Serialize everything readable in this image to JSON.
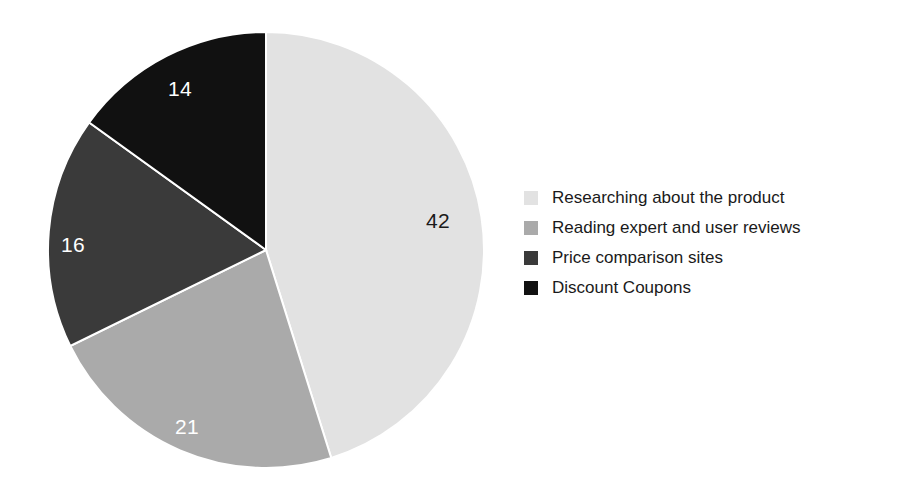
{
  "chart_data": {
    "type": "pie",
    "title": "",
    "subtitle": "",
    "xlabel": "",
    "ylabel": "",
    "grid": false,
    "legend_position": "right",
    "total": 93,
    "start_angle_deg": 0,
    "direction": "clockwise",
    "categories": [
      "Researching about the product",
      "Reading expert and user reviews",
      "Price comparison sites",
      "Discount Coupons"
    ],
    "values": [
      42,
      21,
      16,
      14
    ],
    "value_labels": [
      "42",
      "21",
      "16",
      "14"
    ],
    "colors": [
      "#e2e2e2",
      "#aaaaaa",
      "#3a3a3a",
      "#111111"
    ],
    "label_colors": [
      "#1a1a1a",
      "#ffffff",
      "#ffffff",
      "#ffffff"
    ],
    "slices": [
      {
        "label": "Researching about the product",
        "value": 42,
        "value_text": "42",
        "color": "#e2e2e2",
        "label_color": "#1a1a1a",
        "start_deg": 0,
        "sweep_deg": 162.58,
        "label_x": 438,
        "label_y": 222
      },
      {
        "label": "Reading expert and user reviews",
        "value": 21,
        "value_text": "21",
        "color": "#aaaaaa",
        "label_color": "#ffffff",
        "start_deg": 162.58,
        "sweep_deg": 81.29,
        "label_x": 187,
        "label_y": 428
      },
      {
        "label": "Price comparison sites",
        "value": 16,
        "value_text": "16",
        "color": "#3a3a3a",
        "label_color": "#ffffff",
        "start_deg": 243.87,
        "sweep_deg": 61.94,
        "label_x": 73,
        "label_y": 246
      },
      {
        "label": "Discount Coupons",
        "value": 14,
        "value_text": "14",
        "color": "#111111",
        "label_color": "#ffffff",
        "start_deg": 305.81,
        "sweep_deg": 54.19,
        "label_x": 180,
        "label_y": 90
      }
    ],
    "geometry": {
      "center_x": 266,
      "center_y": 250,
      "radius": 218
    }
  },
  "legend": {
    "items": [
      {
        "label": "Researching about the product",
        "color": "#e2e2e2"
      },
      {
        "label": "Reading expert and user reviews",
        "color": "#aaaaaa"
      },
      {
        "label": "Price comparison sites",
        "color": "#3a3a3a"
      },
      {
        "label": "Discount Coupons",
        "color": "#111111"
      }
    ]
  }
}
